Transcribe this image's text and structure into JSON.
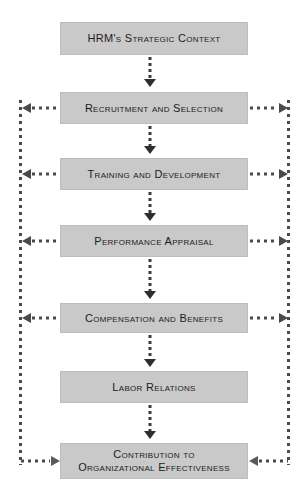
{
  "diagram": {
    "box_fill_color": "#c9c9c9",
    "box_border_color": "#bdbdbd",
    "text_color": "#1b1b1b",
    "connector_color": "#4a4a4a",
    "arrow_color": "#2e2e2e",
    "background_color": "#ffffff",
    "nodes": [
      {
        "id": "hrm-strategic-context",
        "label": "HRM's Strategic Context"
      },
      {
        "id": "recruitment-and-selection",
        "label": "Recruitment and Selection"
      },
      {
        "id": "training-and-development",
        "label": "Training and Development"
      },
      {
        "id": "performance-appraisal",
        "label": "Performance Appraisal"
      },
      {
        "id": "compensation-and-benefits",
        "label": "Compensation and Benefits"
      },
      {
        "id": "labor-relations",
        "label": "Labor Relations"
      },
      {
        "id": "contribution-to-organizational-effectiveness",
        "label": "Contribution to\nOrganizational Effectiveness"
      }
    ],
    "flow_connectors": [
      {
        "from": "hrm-strategic-context",
        "to": "recruitment-and-selection",
        "style": "dotted-down-arrow"
      },
      {
        "from": "recruitment-and-selection",
        "to": "training-and-development",
        "style": "dotted-down-arrow"
      },
      {
        "from": "training-and-development",
        "to": "performance-appraisal",
        "style": "dotted-down-arrow"
      },
      {
        "from": "performance-appraisal",
        "to": "compensation-and-benefits",
        "style": "dotted-down-arrow"
      },
      {
        "from": "compensation-and-benefits",
        "to": "labor-relations",
        "style": "dotted-down-arrow"
      },
      {
        "from": "labor-relations",
        "to": "contribution-to-organizational-effectiveness",
        "style": "dotted-down-arrow"
      }
    ],
    "feedback_rails": [
      {
        "id": "left-feedback-rail",
        "side": "left",
        "style": "dotted-vertical"
      },
      {
        "id": "right-feedback-rail",
        "side": "right",
        "style": "dotted-vertical"
      }
    ],
    "feedback_branches": [
      {
        "node": "recruitment-and-selection",
        "side": "left",
        "direction": "outward"
      },
      {
        "node": "recruitment-and-selection",
        "side": "right",
        "direction": "outward"
      },
      {
        "node": "training-and-development",
        "side": "left",
        "direction": "outward"
      },
      {
        "node": "training-and-development",
        "side": "right",
        "direction": "outward"
      },
      {
        "node": "performance-appraisal",
        "side": "left",
        "direction": "outward"
      },
      {
        "node": "performance-appraisal",
        "side": "right",
        "direction": "outward"
      },
      {
        "node": "compensation-and-benefits",
        "side": "left",
        "direction": "outward"
      },
      {
        "node": "compensation-and-benefits",
        "side": "right",
        "direction": "outward"
      },
      {
        "node": "contribution-to-organizational-effectiveness",
        "side": "left",
        "direction": "inward"
      },
      {
        "node": "contribution-to-organizational-effectiveness",
        "side": "right",
        "direction": "inward"
      }
    ]
  }
}
